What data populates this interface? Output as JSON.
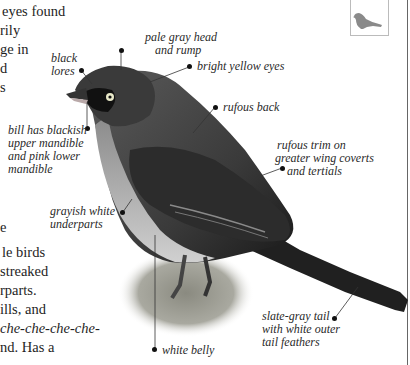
{
  "body_text": {
    "top_lines": [
      "eyes found",
      "rily",
      "ge in",
      "d",
      "s"
    ],
    "middle_line": "e",
    "bottom_lines": [
      {
        "text": "le birds",
        "italic": false
      },
      {
        "text": "streaked",
        "italic": false
      },
      {
        "text": "rparts.",
        "italic": false
      },
      {
        "text": "ills, and",
        "italic": false
      },
      {
        "text": "che-che-che-che-",
        "italic": true
      },
      {
        "text": "nd. Has a",
        "italic": false
      }
    ]
  },
  "thumbnail": {
    "icon": "bird-silhouette-icon",
    "color": "#8a8a8a"
  },
  "callouts": {
    "black_lores": [
      "black",
      "lores"
    ],
    "pale_gray_head": [
      "pale gray head",
      "and rump"
    ],
    "bright_yellow_eyes": "bright yellow eyes",
    "bill": [
      "bill has blackish",
      "upper mandible",
      "and pink lower",
      "mandible"
    ],
    "rufous_back": "rufous back",
    "rufous_trim": [
      "rufous trim on",
      "greater wing coverts",
      "and tertials"
    ],
    "grayish_white_underparts": [
      "grayish white",
      "underparts"
    ],
    "slate_gray_tail": [
      "slate-gray tail",
      "with white outer",
      "tail feathers"
    ],
    "white_belly": "white belly"
  }
}
